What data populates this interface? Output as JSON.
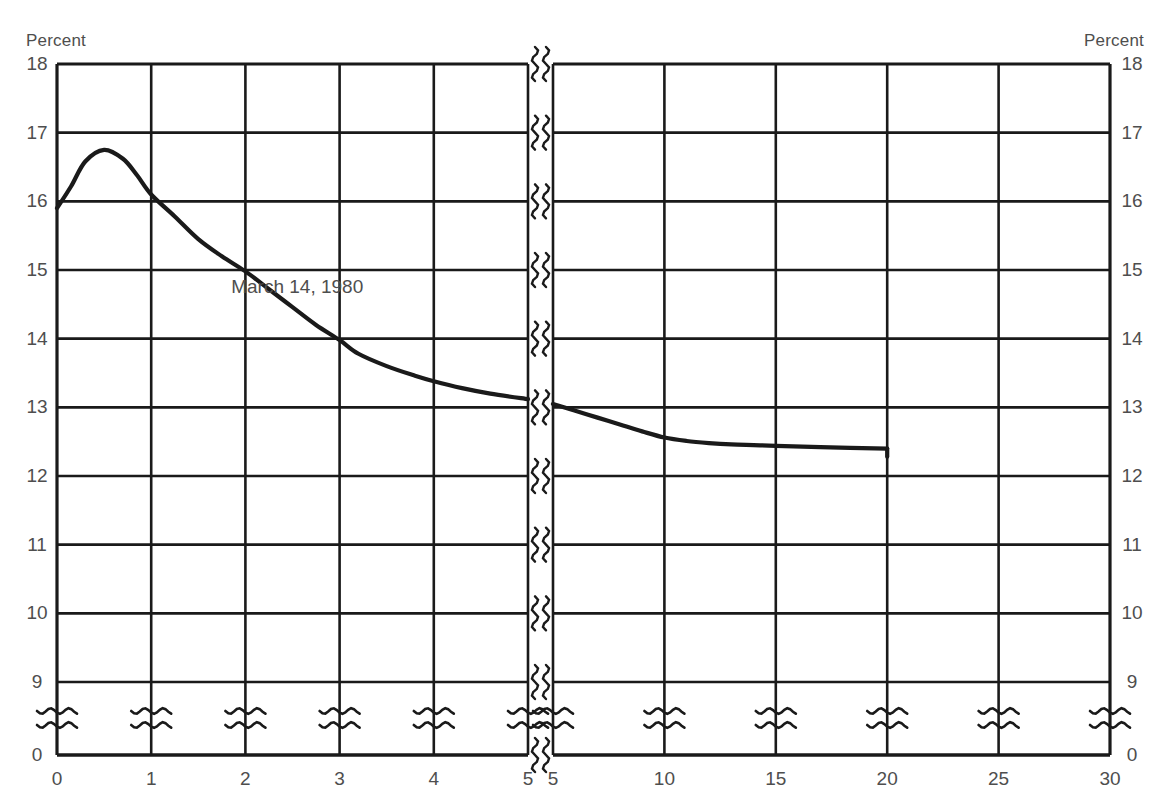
{
  "axis_captions": {
    "left": "Percent",
    "right": "Percent"
  },
  "chart_data": {
    "type": "line",
    "title": "",
    "subtitle": "",
    "xlabel": "",
    "ylabel": "Percent",
    "y2label": "Percent",
    "grid": true,
    "legend": "none",
    "annotations": [
      {
        "text": "March 14, 1980",
        "x": 2.55,
        "y": 14.75
      }
    ],
    "y_ticks": [
      0,
      9,
      10,
      11,
      12,
      13,
      14,
      15,
      16,
      17,
      18
    ],
    "y_tick_labels": [
      "0",
      "9",
      "10",
      "11",
      "12",
      "13",
      "14",
      "15",
      "16",
      "17",
      "18"
    ],
    "ylim": [
      9,
      18
    ],
    "y_axis_break": true,
    "y_break_between": [
      0,
      9
    ],
    "x_axis_break": true,
    "x_break_between": [
      5,
      5
    ],
    "x_segments": [
      {
        "name": "days",
        "ticks": [
          0,
          1,
          2,
          3,
          4,
          5
        ],
        "tick_labels": [
          "0",
          "1",
          "2",
          "3",
          "4",
          "5"
        ]
      },
      {
        "name": "years",
        "ticks": [
          5,
          10,
          15,
          20,
          25,
          30
        ],
        "tick_labels": [
          "5",
          "10",
          "15",
          "20",
          "25",
          "30"
        ]
      }
    ],
    "series": [
      {
        "name": "March 14, 1980",
        "segments": [
          {
            "axis": "left",
            "x": [
              0.0,
              0.15,
              0.3,
              0.5,
              0.7,
              0.85,
              1.0,
              1.25,
              1.5,
              1.75,
              2.0,
              2.25,
              2.5,
              2.75,
              3.0,
              3.2,
              3.5,
              3.8,
              4.0,
              4.3,
              4.6,
              5.0
            ],
            "y": [
              15.9,
              16.22,
              16.58,
              16.75,
              16.62,
              16.38,
              16.1,
              15.78,
              15.45,
              15.2,
              14.98,
              14.72,
              14.46,
              14.2,
              13.98,
              13.78,
              13.6,
              13.46,
              13.38,
              13.28,
              13.2,
              13.12
            ]
          },
          {
            "axis": "right",
            "x": [
              5.0,
              6.0,
              7.0,
              8.0,
              9.0,
              10.0,
              11.0,
              12.0,
              13.0,
              14.0,
              15.0,
              17.0,
              20.0
            ],
            "y": [
              13.05,
              12.95,
              12.85,
              12.75,
              12.65,
              12.56,
              12.51,
              12.48,
              12.46,
              12.45,
              12.44,
              12.42,
              12.4
            ]
          }
        ],
        "end_marker": {
          "x": 20,
          "y_top": 12.4,
          "y_bottom": 12.28
        }
      }
    ]
  },
  "colors": {
    "ink": "#1a1a1a",
    "text": "#4e4e4e",
    "background": "#ffffff"
  }
}
